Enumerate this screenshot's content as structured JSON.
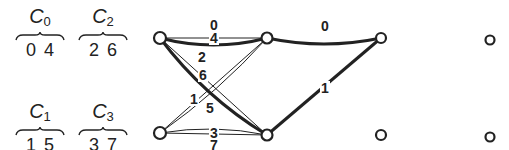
{
  "groups": [
    {
      "name": "C",
      "sub": "0",
      "members": [
        "0",
        "4"
      ],
      "x": 14,
      "y": 6
    },
    {
      "name": "C",
      "sub": "2",
      "members": [
        "2",
        "6"
      ],
      "x": 77,
      "y": 6
    },
    {
      "name": "C",
      "sub": "1",
      "members": [
        "1",
        "5"
      ],
      "x": 14,
      "y": 101
    },
    {
      "name": "C",
      "sub": "3",
      "members": [
        "3",
        "7"
      ],
      "x": 77,
      "y": 101
    }
  ],
  "nodes": [
    {
      "id": "L0",
      "x": 160,
      "y": 38,
      "r": 6
    },
    {
      "id": "L1",
      "x": 160,
      "y": 133,
      "r": 6
    },
    {
      "id": "M0",
      "x": 267,
      "y": 38,
      "r": 5.5
    },
    {
      "id": "M1",
      "x": 267,
      "y": 135,
      "r": 5.5
    },
    {
      "id": "R0",
      "x": 381,
      "y": 38,
      "r": 5
    },
    {
      "id": "R1",
      "x": 381,
      "y": 135,
      "r": 5
    },
    {
      "id": "F0",
      "x": 490,
      "y": 40,
      "r": 4.5
    },
    {
      "id": "F1",
      "x": 490,
      "y": 137,
      "r": 4.5
    }
  ],
  "edges": [
    {
      "label": "0",
      "from": "L0",
      "to": "M0",
      "curve": -14,
      "bold": true,
      "lx": 214,
      "ly": 25
    },
    {
      "label": "4",
      "from": "L0",
      "to": "M0",
      "curve": 0,
      "bold": false,
      "lx": 214,
      "ly": 38
    },
    {
      "label": "2",
      "from": "L0",
      "to": "M1",
      "curve": -14,
      "bold": true,
      "lx": 202,
      "ly": 57
    },
    {
      "label": "6",
      "from": "L0",
      "to": "M1",
      "curve": 0,
      "bold": false,
      "lx": 203,
      "ly": 75
    },
    {
      "label": "1",
      "from": "L1",
      "to": "M0",
      "curve": 0,
      "bold": false,
      "lx": 194,
      "ly": 99
    },
    {
      "label": "5",
      "from": "L1",
      "to": "M0",
      "curve": 8,
      "bold": false,
      "lx": 210,
      "ly": 108
    },
    {
      "label": "3",
      "from": "L1",
      "to": "M1",
      "curve": 0,
      "bold": false,
      "lx": 214,
      "ly": 133
    },
    {
      "label": "7",
      "from": "L1",
      "to": "M1",
      "curve": 10,
      "bold": false,
      "lx": 214,
      "ly": 145
    },
    {
      "label": "0",
      "from": "M0",
      "to": "R0",
      "curve": -12,
      "bold": true,
      "lx": 325,
      "ly": 26
    },
    {
      "label": "1",
      "from": "M1",
      "to": "R0",
      "curve": 0,
      "bold": true,
      "lx": 325,
      "ly": 88
    }
  ],
  "colors": {
    "stroke": "#222222",
    "background": "#ffffff"
  }
}
